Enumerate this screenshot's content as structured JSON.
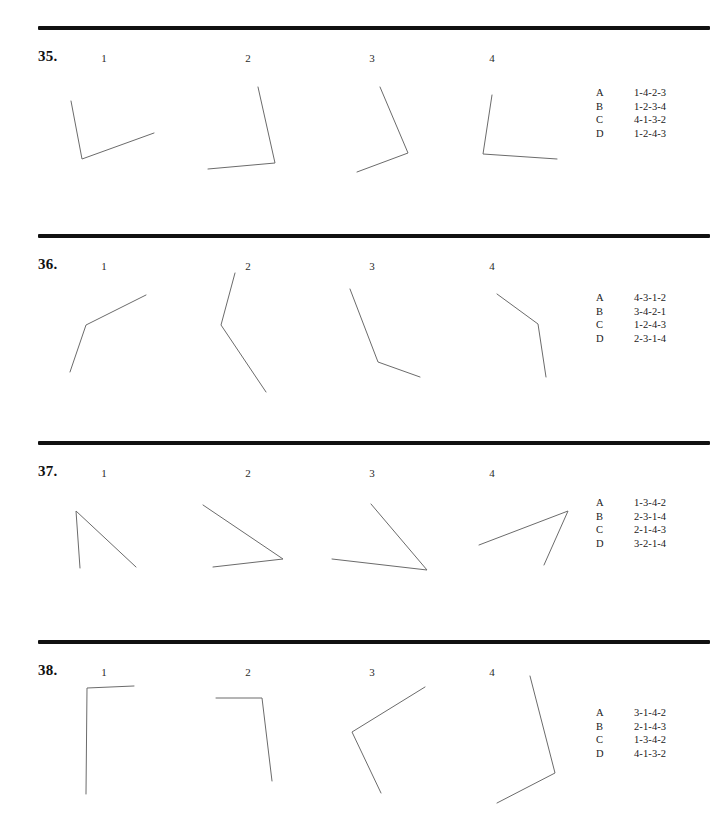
{
  "page": {
    "width": 706,
    "height": 826,
    "background": "#ffffff",
    "ink": "#111111",
    "line_color": "#6b6b6b"
  },
  "questions": [
    {
      "number": "35.",
      "num_x": 38,
      "num_y": 48,
      "rule_y": 26,
      "figure_labels": [
        {
          "text": "1",
          "x": 96,
          "y": 52
        },
        {
          "text": "2",
          "x": 240,
          "y": 52
        },
        {
          "text": "3",
          "x": 364,
          "y": 52
        },
        {
          "text": "4",
          "x": 484,
          "y": 52
        }
      ],
      "figures": [
        {
          "name": "figure-35-1",
          "points": [
            [
              71,
              101
            ],
            [
              82,
              159
            ],
            [
              154,
              133
            ]
          ]
        },
        {
          "name": "figure-35-2",
          "points": [
            [
              258,
              87
            ],
            [
              275,
              163
            ],
            [
              208,
              169
            ]
          ]
        },
        {
          "name": "figure-35-3",
          "points": [
            [
              380,
              87
            ],
            [
              408,
              153
            ],
            [
              357,
              172
            ]
          ]
        },
        {
          "name": "figure-35-4",
          "points": [
            [
              492,
              95
            ],
            [
              483,
              154
            ],
            [
              557,
              159
            ]
          ]
        }
      ],
      "answers": {
        "x": 596,
        "y": 86,
        "options": [
          {
            "letter": "A",
            "sequence": "1-4-2-3"
          },
          {
            "letter": "B",
            "sequence": "1-2-3-4"
          },
          {
            "letter": "C",
            "sequence": "4-1-3-2"
          },
          {
            "letter": "D",
            "sequence": "1-2-4-3"
          }
        ]
      }
    },
    {
      "number": "36.",
      "num_x": 38,
      "num_y": 256,
      "rule_y": 234,
      "figure_labels": [
        {
          "text": "1",
          "x": 96,
          "y": 260
        },
        {
          "text": "2",
          "x": 240,
          "y": 260
        },
        {
          "text": "3",
          "x": 364,
          "y": 260
        },
        {
          "text": "4",
          "x": 484,
          "y": 260
        }
      ],
      "figures": [
        {
          "name": "figure-36-1",
          "points": [
            [
              146,
              295
            ],
            [
              86,
              325
            ],
            [
              70,
              372
            ]
          ]
        },
        {
          "name": "figure-36-2",
          "points": [
            [
              235,
              273
            ],
            [
              221,
              325
            ],
            [
              266,
              392
            ]
          ]
        },
        {
          "name": "figure-36-3",
          "points": [
            [
              350,
              289
            ],
            [
              378,
              362
            ],
            [
              420,
              377
            ]
          ]
        },
        {
          "name": "figure-36-4",
          "points": [
            [
              497,
              294
            ],
            [
              538,
              324
            ],
            [
              546,
              377
            ]
          ]
        }
      ],
      "answers": {
        "x": 596,
        "y": 291,
        "options": [
          {
            "letter": "A",
            "sequence": "4-3-1-2"
          },
          {
            "letter": "B",
            "sequence": "3-4-2-1"
          },
          {
            "letter": "C",
            "sequence": "1-2-4-3"
          },
          {
            "letter": "D",
            "sequence": "2-3-1-4"
          }
        ]
      }
    },
    {
      "number": "37.",
      "num_x": 38,
      "num_y": 463,
      "rule_y": 441,
      "figure_labels": [
        {
          "text": "1",
          "x": 96,
          "y": 467
        },
        {
          "text": "2",
          "x": 240,
          "y": 467
        },
        {
          "text": "3",
          "x": 364,
          "y": 467
        },
        {
          "text": "4",
          "x": 484,
          "y": 467
        }
      ],
      "figures": [
        {
          "name": "figure-37-1",
          "points": [
            [
              80,
              568
            ],
            [
              76,
              511
            ],
            [
              136,
              567
            ]
          ]
        },
        {
          "name": "figure-37-2",
          "points": [
            [
              203,
              505
            ],
            [
              283,
              559
            ],
            [
              213,
              567
            ]
          ]
        },
        {
          "name": "figure-37-3",
          "points": [
            [
              371,
              504
            ],
            [
              427,
              570
            ],
            [
              332,
              559
            ]
          ]
        },
        {
          "name": "figure-37-4",
          "points": [
            [
              479,
              545
            ],
            [
              568,
              511
            ],
            [
              544,
              565
            ]
          ]
        }
      ],
      "answers": {
        "x": 596,
        "y": 496,
        "options": [
          {
            "letter": "A",
            "sequence": "1-3-4-2"
          },
          {
            "letter": "B",
            "sequence": "2-3-1-4"
          },
          {
            "letter": "C",
            "sequence": "2-1-4-3"
          },
          {
            "letter": "D",
            "sequence": "3-2-1-4"
          }
        ]
      }
    },
    {
      "number": "38.",
      "num_x": 38,
      "num_y": 662,
      "rule_y": 640,
      "figure_labels": [
        {
          "text": "1",
          "x": 96,
          "y": 666
        },
        {
          "text": "2",
          "x": 240,
          "y": 666
        },
        {
          "text": "3",
          "x": 364,
          "y": 666
        },
        {
          "text": "4",
          "x": 484,
          "y": 666
        }
      ],
      "figures": [
        {
          "name": "figure-38-1",
          "points": [
            [
              134,
              686
            ],
            [
              87,
              688
            ],
            [
              86,
              794
            ]
          ]
        },
        {
          "name": "figure-38-2",
          "points": [
            [
              216,
              698
            ],
            [
              262,
              698
            ],
            [
              272,
              781
            ]
          ]
        },
        {
          "name": "figure-38-3",
          "points": [
            [
              425,
              687
            ],
            [
              352,
              732
            ],
            [
              381,
              793
            ]
          ]
        },
        {
          "name": "figure-38-4",
          "points": [
            [
              530,
              676
            ],
            [
              555,
              773
            ],
            [
              497,
              803
            ]
          ]
        }
      ],
      "answers": {
        "x": 596,
        "y": 706,
        "options": [
          {
            "letter": "A",
            "sequence": "3-1-4-2"
          },
          {
            "letter": "B",
            "sequence": "2-1-4-3"
          },
          {
            "letter": "C",
            "sequence": "1-3-4-2"
          },
          {
            "letter": "D",
            "sequence": "4-1-3-2"
          }
        ]
      }
    }
  ]
}
